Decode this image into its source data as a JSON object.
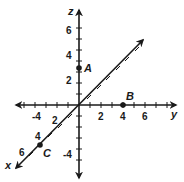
{
  "diagram": {
    "type": "3d-coordinate-axes",
    "origin_px": [
      79,
      105
    ],
    "unit_px": 11,
    "axes": {
      "x": {
        "label": "x",
        "direction": "diagonal toward lower-left",
        "tick_labels": [
          "2",
          "4",
          "6"
        ]
      },
      "y": {
        "label": "y",
        "direction": "horizontal right",
        "tick_labels": [
          "-4",
          "2",
          "4",
          "6"
        ]
      },
      "z": {
        "label": "z",
        "direction": "vertical up",
        "tick_labels": [
          "2",
          "4",
          "6",
          "-4"
        ]
      }
    },
    "points": [
      {
        "name": "A",
        "coords": [
          0,
          0,
          3
        ]
      },
      {
        "name": "B",
        "coords": [
          0,
          4,
          0
        ]
      },
      {
        "name": "C",
        "coords": [
          4,
          0,
          0
        ]
      }
    ],
    "color": "#1a1a1a"
  },
  "labels": {
    "x_axis": "x",
    "y_axis": "y",
    "z_axis": "z",
    "point_a": "A",
    "point_b": "B",
    "point_c": "C",
    "y_tick_neg4": "-4",
    "y_tick_2": "2",
    "y_tick_4": "4",
    "y_tick_6": "6",
    "z_tick_2": "2",
    "z_tick_4": "4",
    "z_tick_6": "6",
    "z_tick_neg4": "-4",
    "x_tick_2": "2",
    "x_tick_4": "4",
    "x_tick_6": "6"
  }
}
